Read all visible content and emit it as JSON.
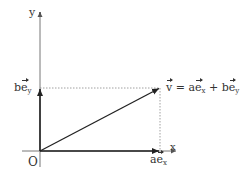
{
  "diagram": {
    "type": "vector-decomposition",
    "axes": {
      "x_label": "x",
      "y_label": "y",
      "origin_label": "O"
    },
    "labels": {
      "y_component": {
        "coef": "b",
        "vec": "e",
        "sub": "y"
      },
      "x_component": {
        "coef": "a",
        "vec": "e",
        "sub": "x"
      },
      "vector_equation": {
        "lhs": "v",
        "equals": "=",
        "term1_coef": "a",
        "term1_vec": "e",
        "term1_sub": "x",
        "plus": "+",
        "term2_coef": "b",
        "term2_vec": "e",
        "term2_sub": "y"
      }
    },
    "colors": {
      "axis": "#555555",
      "vector": "#333333",
      "dotted": "#777777",
      "text": "#333333"
    }
  }
}
